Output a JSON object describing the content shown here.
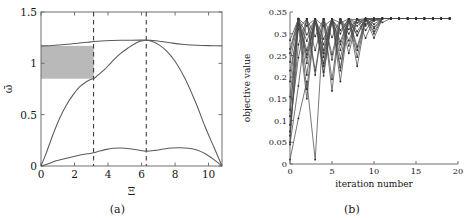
{
  "figure": {
    "panel_a_caption": "(a)",
    "panel_b_caption": "(b)"
  },
  "chart_data": [
    {
      "type": "line",
      "panel": "(a)",
      "title": "",
      "xlabel": "Ξ",
      "ylabel": "ω̄",
      "xlim": [
        0,
        10.8
      ],
      "ylim": [
        0,
        1.5
      ],
      "xticks": [
        0,
        2,
        4,
        6,
        8,
        10
      ],
      "xticklabels": [
        "0",
        "2",
        "4",
        "6",
        "8",
        "10"
      ],
      "yticks": [
        0,
        0.5,
        1,
        1.5
      ],
      "yticklabels": [
        "0",
        "0.5",
        "1",
        "1.5"
      ],
      "grid": false,
      "legend": "none",
      "annotations": {
        "vertical_dashed_lines": [
          3.14,
          6.28
        ],
        "shaded_band": {
          "x_range": [
            0,
            3.15
          ],
          "y_range": [
            0.85,
            1.17
          ],
          "color": "#b9b9b9",
          "label": "band gap"
        }
      },
      "series": [
        {
          "name": "branch-1",
          "x": [
            0,
            0.4,
            0.9,
            1.4,
            1.9,
            2.4,
            2.8,
            3.14,
            3.5,
            3.9,
            4.3,
            4.8,
            5.3,
            5.8,
            6.28,
            6.8,
            7.3,
            7.8,
            8.3,
            8.8,
            9.3,
            9.8,
            10.3,
            10.8
          ],
          "y": [
            0.0,
            0.02,
            0.05,
            0.07,
            0.09,
            0.11,
            0.12,
            0.128,
            0.145,
            0.162,
            0.172,
            0.175,
            0.168,
            0.155,
            0.145,
            0.152,
            0.165,
            0.175,
            0.178,
            0.172,
            0.155,
            0.12,
            0.065,
            0.0
          ]
        },
        {
          "name": "branch-2",
          "x": [
            0,
            0.3,
            0.7,
            1.1,
            1.5,
            1.9,
            2.3,
            2.7,
            3.0,
            3.14,
            3.4,
            3.8,
            4.2,
            4.7,
            5.2,
            5.7,
            6.0,
            6.28,
            6.6,
            7.0,
            7.5,
            8.0,
            8.6,
            9.2,
            9.8,
            10.3,
            10.8
          ],
          "y": [
            0.0,
            0.12,
            0.3,
            0.46,
            0.59,
            0.69,
            0.77,
            0.82,
            0.845,
            0.85,
            0.885,
            0.94,
            1.01,
            1.09,
            1.15,
            1.2,
            1.218,
            1.225,
            1.215,
            1.185,
            1.12,
            1.02,
            0.85,
            0.63,
            0.38,
            0.19,
            0.0
          ]
        },
        {
          "name": "branch-3",
          "x": [
            0,
            0.5,
            1.0,
            1.6,
            2.2,
            2.8,
            3.14,
            3.6,
            4.2,
            4.8,
            5.4,
            5.9,
            6.28,
            6.7,
            7.2,
            7.8,
            8.4,
            9.0,
            9.6,
            10.2,
            10.8
          ],
          "y": [
            1.17,
            1.172,
            1.178,
            1.186,
            1.196,
            1.206,
            1.212,
            1.218,
            1.222,
            1.224,
            1.225,
            1.226,
            1.226,
            1.222,
            1.212,
            1.198,
            1.186,
            1.178,
            1.174,
            1.172,
            1.17
          ]
        }
      ]
    },
    {
      "type": "line",
      "panel": "(b)",
      "title": "",
      "xlabel": "iteration number",
      "ylabel": "objective value",
      "xlim": [
        0,
        20
      ],
      "ylim": [
        0,
        0.35
      ],
      "xticks": [
        0,
        5,
        10,
        15,
        20
      ],
      "xticklabels": [
        "0",
        "5",
        "10",
        "15",
        "20"
      ],
      "yticks": [
        0,
        0.05,
        0.1,
        0.15,
        0.2,
        0.25,
        0.3,
        0.35
      ],
      "yticklabels": [
        "0",
        "0.05",
        "0.1",
        "0.15",
        "0.2",
        "0.25",
        "0.3",
        "0.35"
      ],
      "grid": false,
      "legend": "none",
      "marker": "dot",
      "converged_value": 0.335,
      "series": [
        {
          "name": "run-1",
          "x": [
            0,
            1,
            2,
            3,
            4,
            5,
            6,
            7,
            8,
            9,
            10,
            11,
            12,
            13,
            14,
            15,
            16,
            17,
            18,
            19
          ],
          "y": [
            0.065,
            0.335,
            0.245,
            0.333,
            0.262,
            0.334,
            0.3,
            0.334,
            0.318,
            0.335,
            0.33,
            0.335,
            0.335,
            0.335,
            0.335,
            0.335,
            0.335,
            0.335,
            0.335,
            0.335
          ]
        },
        {
          "name": "run-2",
          "x": [
            0,
            1,
            2,
            3,
            4,
            5,
            6,
            7,
            8,
            9,
            10,
            11,
            12,
            13,
            14,
            15,
            16,
            17,
            18,
            19
          ],
          "y": [
            0.05,
            0.32,
            0.15,
            0.33,
            0.225,
            0.332,
            0.275,
            0.334,
            0.305,
            0.334,
            0.322,
            0.335,
            0.335,
            0.335,
            0.335,
            0.335,
            0.335,
            0.335,
            0.335,
            0.335
          ]
        },
        {
          "name": "run-3",
          "x": [
            0,
            1,
            2,
            3,
            4,
            5,
            6,
            7,
            8,
            9,
            10,
            11,
            12,
            13,
            14,
            15,
            16,
            17,
            18,
            19
          ],
          "y": [
            0.01,
            0.105,
            0.19,
            0.01,
            0.33,
            0.195,
            0.333,
            0.255,
            0.334,
            0.29,
            0.335,
            0.326,
            0.335,
            0.335,
            0.335,
            0.335,
            0.335,
            0.335,
            0.335,
            0.335
          ]
        },
        {
          "name": "run-4",
          "x": [
            0,
            1,
            2,
            3,
            4,
            5,
            6,
            7,
            8,
            9,
            10,
            11,
            12,
            13,
            14,
            15,
            16,
            17,
            18,
            19
          ],
          "y": [
            0.255,
            0.333,
            0.283,
            0.334,
            0.246,
            0.334,
            0.222,
            0.334,
            0.296,
            0.335,
            0.305,
            0.335,
            0.335,
            0.335,
            0.335,
            0.335,
            0.335,
            0.335,
            0.335,
            0.335
          ]
        },
        {
          "name": "run-5",
          "x": [
            0,
            1,
            2,
            3,
            4,
            5,
            6,
            7,
            8,
            9,
            10,
            11,
            12,
            13,
            14,
            15,
            16,
            17,
            18,
            19
          ],
          "y": [
            0.125,
            0.33,
            0.262,
            0.334,
            0.203,
            0.334,
            0.262,
            0.333,
            0.225,
            0.334,
            0.29,
            0.335,
            0.335,
            0.335,
            0.335,
            0.335,
            0.335,
            0.335,
            0.335,
            0.335
          ]
        },
        {
          "name": "run-6",
          "x": [
            0,
            1,
            2,
            3,
            4,
            5,
            6,
            7,
            8,
            9,
            10,
            11,
            12,
            13,
            14,
            15,
            16,
            17,
            18,
            19
          ],
          "y": [
            0.075,
            0.275,
            0.334,
            0.262,
            0.334,
            0.168,
            0.334,
            0.284,
            0.334,
            0.318,
            0.335,
            0.335,
            0.335,
            0.335,
            0.335,
            0.335,
            0.335,
            0.335,
            0.335,
            0.335
          ]
        },
        {
          "name": "run-7",
          "x": [
            0,
            1,
            2,
            3,
            4,
            5,
            6,
            7,
            8,
            9,
            10,
            11,
            12,
            13,
            14,
            15,
            16,
            17,
            18,
            19
          ],
          "y": [
            0.19,
            0.334,
            0.232,
            0.334,
            0.288,
            0.334,
            0.243,
            0.334,
            0.262,
            0.334,
            0.312,
            0.335,
            0.335,
            0.335,
            0.335,
            0.335,
            0.335,
            0.335,
            0.335,
            0.335
          ]
        },
        {
          "name": "run-8",
          "x": [
            0,
            1,
            2,
            3,
            4,
            5,
            6,
            7,
            8,
            9,
            10,
            11,
            12,
            13,
            14,
            15,
            16,
            17,
            18,
            19
          ],
          "y": [
            0.235,
            0.332,
            0.205,
            0.334,
            0.318,
            0.332,
            0.215,
            0.334,
            0.296,
            0.335,
            0.33,
            0.335,
            0.335,
            0.335,
            0.335,
            0.335,
            0.335,
            0.335,
            0.335,
            0.335
          ]
        },
        {
          "name": "run-9",
          "x": [
            0,
            1,
            2,
            3,
            4,
            5,
            6,
            7,
            8,
            9,
            10,
            11,
            12,
            13,
            14,
            15,
            16,
            17,
            18,
            19
          ],
          "y": [
            0.09,
            0.245,
            0.334,
            0.294,
            0.334,
            0.252,
            0.334,
            0.3,
            0.334,
            0.322,
            0.335,
            0.335,
            0.335,
            0.335,
            0.335,
            0.335,
            0.335,
            0.335,
            0.335,
            0.335
          ]
        },
        {
          "name": "run-10",
          "x": [
            0,
            1,
            2,
            3,
            4,
            5,
            6,
            7,
            8,
            9,
            10,
            11,
            12,
            13,
            14,
            15,
            16,
            17,
            18,
            19
          ],
          "y": [
            0.155,
            0.334,
            0.298,
            0.334,
            0.232,
            0.334,
            0.282,
            0.334,
            0.246,
            0.334,
            0.3,
            0.335,
            0.335,
            0.335,
            0.335,
            0.335,
            0.335,
            0.335,
            0.335,
            0.335
          ]
        },
        {
          "name": "run-11",
          "x": [
            0,
            1,
            2,
            3,
            4,
            5,
            6,
            7,
            8,
            9,
            10,
            11,
            12,
            13,
            14,
            15,
            16,
            17,
            18,
            19
          ],
          "y": [
            0.285,
            0.334,
            0.252,
            0.334,
            0.275,
            0.333,
            0.308,
            0.334,
            0.325,
            0.335,
            0.335,
            0.335,
            0.335,
            0.335,
            0.335,
            0.335,
            0.335,
            0.335,
            0.335,
            0.335
          ]
        },
        {
          "name": "run-12",
          "x": [
            0,
            1,
            2,
            3,
            4,
            5,
            6,
            7,
            8,
            9,
            10,
            11,
            12,
            13,
            14,
            15,
            16,
            17,
            18,
            19
          ],
          "y": [
            0.215,
            0.31,
            0.334,
            0.215,
            0.334,
            0.292,
            0.334,
            0.272,
            0.334,
            0.308,
            0.334,
            0.335,
            0.335,
            0.335,
            0.335,
            0.335,
            0.335,
            0.335,
            0.335,
            0.335
          ]
        },
        {
          "name": "run-13",
          "x": [
            0,
            1,
            2,
            3,
            4,
            5,
            6,
            7,
            8,
            9,
            10,
            11,
            12,
            13,
            14,
            15,
            16,
            17,
            18,
            19
          ],
          "y": [
            0.045,
            0.18,
            0.334,
            0.205,
            0.334,
            0.24,
            0.333,
            0.31,
            0.334,
            0.33,
            0.335,
            0.335,
            0.335,
            0.335,
            0.335,
            0.335,
            0.335,
            0.335,
            0.335,
            0.335
          ]
        },
        {
          "name": "run-14",
          "x": [
            0,
            1,
            2,
            3,
            4,
            5,
            6,
            7,
            8,
            9,
            10,
            11,
            12,
            13,
            14,
            15,
            16,
            17,
            18,
            19
          ],
          "y": [
            0.265,
            0.334,
            0.318,
            0.334,
            0.255,
            0.334,
            0.325,
            0.334,
            0.332,
            0.335,
            0.335,
            0.335,
            0.335,
            0.335,
            0.335,
            0.335,
            0.335,
            0.335,
            0.335,
            0.335
          ]
        },
        {
          "name": "run-15",
          "x": [
            0,
            1,
            2,
            3,
            4,
            5,
            6,
            7,
            8,
            9,
            10,
            11,
            12,
            13,
            14,
            15,
            16,
            17,
            18,
            19
          ],
          "y": [
            0.11,
            0.334,
            0.172,
            0.334,
            0.212,
            0.333,
            0.19,
            0.334,
            0.27,
            0.334,
            0.316,
            0.335,
            0.335,
            0.335,
            0.335,
            0.335,
            0.335,
            0.335,
            0.335,
            0.335
          ]
        }
      ]
    }
  ]
}
